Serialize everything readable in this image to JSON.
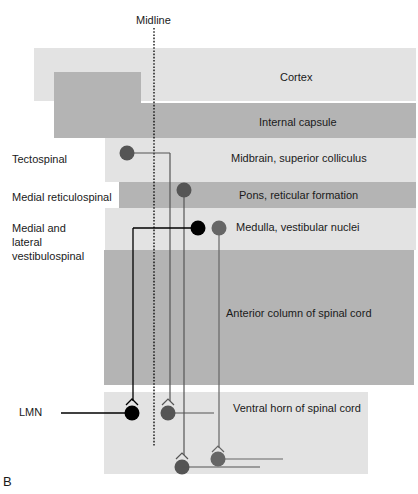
{
  "figure": {
    "panel_label": "B",
    "midline_label": "Midline"
  },
  "regions": [
    {
      "id": "cortex",
      "label": "Cortex",
      "shade": "light"
    },
    {
      "id": "internal-capsule",
      "label": "Internal capsule",
      "shade": "dark"
    },
    {
      "id": "midbrain",
      "label": "Midbrain, superior colliculus",
      "shade": "light"
    },
    {
      "id": "pons",
      "label": "Pons, reticular formation",
      "shade": "dark"
    },
    {
      "id": "medulla",
      "label": "Medulla, vestibular nuclei",
      "shade": "light"
    },
    {
      "id": "anterior-column",
      "label": "Anterior column of spinal cord",
      "shade": "dark"
    },
    {
      "id": "ventral-horn",
      "label": "Ventral horn of spinal cord",
      "shade": "light"
    }
  ],
  "tracts": [
    {
      "id": "tectospinal",
      "label": "Tectospinal",
      "origin": "midbrain",
      "color": "#555555"
    },
    {
      "id": "medial-reticulospinal",
      "label": "Medial reticulospinal",
      "origin": "pons",
      "color": "#555555"
    },
    {
      "id": "vestibulospinal",
      "label_lines": [
        "Medial and",
        "lateral",
        "vestibulospinal"
      ],
      "origin": "medulla",
      "colors": [
        "#000000",
        "#666666"
      ]
    }
  ],
  "lmn": {
    "label": "LMN"
  },
  "colors": {
    "light_band": "#e3e3e3",
    "dark_band": "#b4b4b4",
    "neuron_gray": "#555555",
    "neuron_black": "#000000"
  }
}
